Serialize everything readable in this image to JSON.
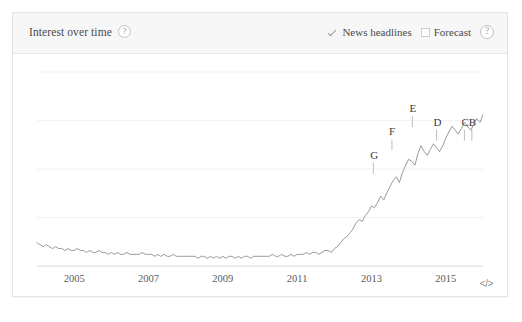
{
  "panel": {
    "header": {
      "title": "Interest over time",
      "title_help_icon": "question-mark-icon",
      "news_headlines": {
        "label": "News headlines",
        "checked": true,
        "icon": "check-icon"
      },
      "forecast": {
        "label": "Forecast",
        "checked": false,
        "icon": "empty-checkbox-icon"
      },
      "help_icon": "question-mark-icon"
    },
    "footer": {
      "embed_label": "</>",
      "embed_icon": "embed-code-icon"
    }
  },
  "chart_data": {
    "type": "line",
    "title": "Interest over time",
    "xlabel": "",
    "ylabel": "",
    "grid": true,
    "legend": "none",
    "line_color": "#9a9a9a",
    "xlim": [
      2004.0,
      2016.0
    ],
    "ylim": [
      0,
      100
    ],
    "tick_labels": [
      "2005",
      "2007",
      "2009",
      "2011",
      "2013",
      "2015"
    ],
    "tick_values": [
      2005,
      2007,
      2009,
      2011,
      2013,
      2015
    ],
    "gridline_values": [
      100,
      75,
      50,
      25
    ],
    "annotations": [
      {
        "label": "G",
        "x": 2013.05,
        "y": 46
      },
      {
        "label": "F",
        "x": 2013.55,
        "y": 58
      },
      {
        "label": "E",
        "x": 2014.1,
        "y": 70
      },
      {
        "label": "D",
        "x": 2014.75,
        "y": 63
      },
      {
        "label": "C",
        "x": 2015.5,
        "y": 63
      },
      {
        "label": "B",
        "x": 2015.7,
        "y": 63
      }
    ],
    "x": [
      2004.0,
      2004.08,
      2004.17,
      2004.25,
      2004.33,
      2004.42,
      2004.5,
      2004.58,
      2004.67,
      2004.75,
      2004.83,
      2004.92,
      2005.0,
      2005.08,
      2005.17,
      2005.25,
      2005.33,
      2005.42,
      2005.5,
      2005.58,
      2005.67,
      2005.75,
      2005.83,
      2005.92,
      2006.0,
      2006.08,
      2006.17,
      2006.25,
      2006.33,
      2006.42,
      2006.5,
      2006.58,
      2006.67,
      2006.75,
      2006.83,
      2006.92,
      2007.0,
      2007.08,
      2007.17,
      2007.25,
      2007.33,
      2007.42,
      2007.5,
      2007.58,
      2007.67,
      2007.75,
      2007.83,
      2007.92,
      2008.0,
      2008.08,
      2008.17,
      2008.25,
      2008.33,
      2008.42,
      2008.5,
      2008.58,
      2008.67,
      2008.75,
      2008.83,
      2008.92,
      2009.0,
      2009.08,
      2009.17,
      2009.25,
      2009.33,
      2009.42,
      2009.5,
      2009.58,
      2009.67,
      2009.75,
      2009.83,
      2009.92,
      2010.0,
      2010.08,
      2010.17,
      2010.25,
      2010.33,
      2010.42,
      2010.5,
      2010.58,
      2010.67,
      2010.75,
      2010.83,
      2010.92,
      2011.0,
      2011.08,
      2011.17,
      2011.25,
      2011.33,
      2011.42,
      2011.5,
      2011.58,
      2011.67,
      2011.75,
      2011.83,
      2011.92,
      2012.0,
      2012.08,
      2012.17,
      2012.25,
      2012.33,
      2012.42,
      2012.5,
      2012.58,
      2012.67,
      2012.75,
      2012.83,
      2012.92,
      2013.0,
      2013.08,
      2013.17,
      2013.25,
      2013.33,
      2013.42,
      2013.5,
      2013.58,
      2013.67,
      2013.75,
      2013.83,
      2013.92,
      2014.0,
      2014.08,
      2014.17,
      2014.25,
      2014.33,
      2014.42,
      2014.5,
      2014.58,
      2014.67,
      2014.75,
      2014.83,
      2014.92,
      2015.0,
      2015.08,
      2015.17,
      2015.25,
      2015.33,
      2015.42,
      2015.5,
      2015.58,
      2015.67,
      2015.75,
      2015.83,
      2015.92,
      2016.0
    ],
    "values": [
      12,
      11,
      10,
      11,
      10,
      9,
      10,
      9,
      9,
      8,
      9,
      8,
      8,
      9,
      8,
      8,
      7,
      8,
      7,
      7,
      8,
      7,
      7,
      6,
      7,
      6,
      7,
      6,
      6,
      7,
      6,
      6,
      6,
      6,
      7,
      6,
      6,
      6,
      5,
      6,
      5,
      6,
      5,
      5,
      6,
      5,
      5,
      5,
      5,
      5,
      5,
      5,
      4,
      5,
      5,
      4,
      5,
      4,
      5,
      4,
      5,
      4,
      5,
      5,
      4,
      5,
      4,
      5,
      5,
      4,
      5,
      5,
      5,
      5,
      5,
      5,
      6,
      5,
      5,
      6,
      5,
      5,
      6,
      5,
      6,
      6,
      6,
      7,
      6,
      7,
      7,
      6,
      7,
      8,
      8,
      7,
      9,
      10,
      12,
      14,
      15,
      17,
      19,
      22,
      24,
      23,
      26,
      28,
      31,
      30,
      33,
      36,
      34,
      38,
      41,
      44,
      46,
      43,
      48,
      52,
      55,
      54,
      52,
      58,
      62,
      59,
      57,
      60,
      63,
      61,
      59,
      62,
      66,
      69,
      72,
      70,
      68,
      71,
      74,
      72,
      70,
      73,
      76,
      74,
      78
    ]
  }
}
